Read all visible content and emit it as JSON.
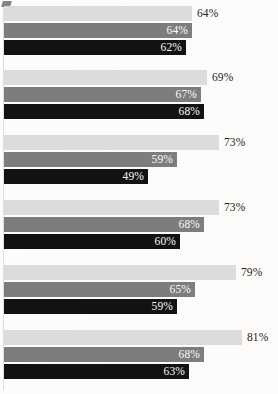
{
  "chart": {
    "type": "bar",
    "orientation": "horizontal",
    "title": "",
    "subtitle": "",
    "xlabel": "",
    "ylabel": "",
    "xlim": [
      0,
      100
    ],
    "grid": false,
    "legend": "none",
    "value_suffix": "%",
    "series_names": [
      "Series 1",
      "Series 2",
      "Series 3"
    ],
    "series_colors": [
      "#dcdcdc",
      "#7d7d7d",
      "#121212"
    ],
    "label_colors": [
      "#232323",
      "#fbfbfb",
      "#fbfbfb"
    ]
  },
  "chart_data": {
    "type": "bar",
    "orientation": "horizontal",
    "title": "",
    "xlabel": "",
    "ylabel": "",
    "xlim": [
      0,
      100
    ],
    "grid": false,
    "legend": "none",
    "categories": [
      "Group 1",
      "Group 2",
      "Group 3",
      "Group 4",
      "Group 5",
      "Group 6"
    ],
    "series": [
      {
        "name": "Series 1",
        "color": "#dcdcdc",
        "values": [
          64,
          69,
          73,
          73,
          79,
          81
        ]
      },
      {
        "name": "Series 2",
        "color": "#7d7d7d",
        "values": [
          64,
          67,
          59,
          68,
          65,
          68
        ]
      },
      {
        "name": "Series 3",
        "color": "#121212",
        "values": [
          62,
          68,
          49,
          60,
          59,
          63
        ]
      }
    ]
  },
  "groups": [
    {
      "name": "group-1",
      "bars": [
        {
          "value": 64,
          "label": "64%",
          "style": "light"
        },
        {
          "value": 64,
          "label": "64%",
          "style": "mid"
        },
        {
          "value": 62,
          "label": "62%",
          "style": "dark"
        }
      ]
    },
    {
      "name": "group-2",
      "bars": [
        {
          "value": 69,
          "label": "69%",
          "style": "light"
        },
        {
          "value": 67,
          "label": "67%",
          "style": "mid"
        },
        {
          "value": 68,
          "label": "68%",
          "style": "dark"
        }
      ]
    },
    {
      "name": "group-3",
      "bars": [
        {
          "value": 73,
          "label": "73%",
          "style": "light"
        },
        {
          "value": 59,
          "label": "59%",
          "style": "mid"
        },
        {
          "value": 49,
          "label": "49%",
          "style": "dark"
        }
      ]
    },
    {
      "name": "group-4",
      "bars": [
        {
          "value": 73,
          "label": "73%",
          "style": "light"
        },
        {
          "value": 68,
          "label": "68%",
          "style": "mid"
        },
        {
          "value": 60,
          "label": "60%",
          "style": "dark"
        }
      ]
    },
    {
      "name": "group-5",
      "bars": [
        {
          "value": 79,
          "label": "79%",
          "style": "light"
        },
        {
          "value": 65,
          "label": "65%",
          "style": "mid"
        },
        {
          "value": 59,
          "label": "59%",
          "style": "dark"
        }
      ]
    },
    {
      "name": "group-6",
      "bars": [
        {
          "value": 81,
          "label": "81%",
          "style": "light"
        },
        {
          "value": 68,
          "label": "68%",
          "style": "mid"
        },
        {
          "value": 63,
          "label": "63%",
          "style": "dark"
        }
      ]
    }
  ]
}
